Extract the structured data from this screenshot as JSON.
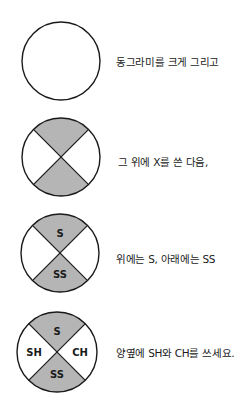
{
  "colors": {
    "stroke": "#1a1a1a",
    "shaded": "#b5b5b5",
    "background": "#ffffff"
  },
  "steps": [
    {
      "caption": "동그라미를 크게 그리고",
      "labels": {}
    },
    {
      "caption": "그 위에 X를 쓴 다음,",
      "labels": {}
    },
    {
      "caption": "위에는 S, 아래에는 SS",
      "labels": {
        "top": "S",
        "bottom": "SS"
      }
    },
    {
      "caption": "양옆에 SH와 CH를 쓰세요.",
      "labels": {
        "top": "S",
        "bottom": "SS",
        "left": "SH",
        "right": "CH"
      }
    }
  ]
}
